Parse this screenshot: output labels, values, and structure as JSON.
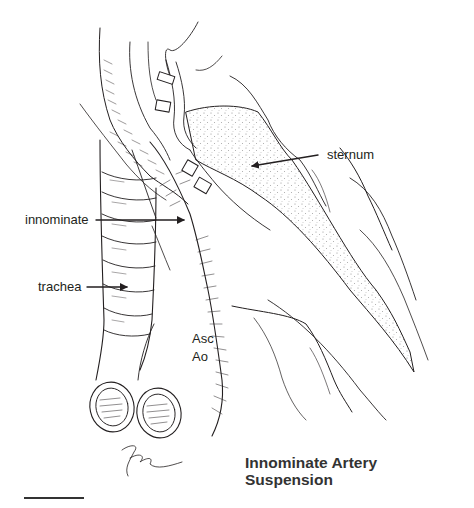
{
  "figure": {
    "title_line1": "Innominate Artery",
    "title_line2": "Suspension",
    "labels": {
      "sternum": "sternum",
      "innominate": "innominate",
      "trachea": "trachea",
      "asc": "Asc",
      "ao": "Ao"
    },
    "signature": "artist-signature",
    "scale_bar": true
  },
  "colors": {
    "ink": "#231f20",
    "background": "#ffffff",
    "stipple": "#8a8a8a"
  }
}
